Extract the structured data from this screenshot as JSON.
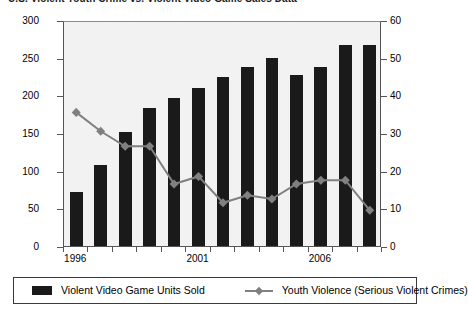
{
  "title": "U.S. Violent Youth Crime vs. Violent Video Game Sales Data",
  "legend": {
    "bars_label": "Violent Video Game Units Sold",
    "line_label": "Youth Violence (Serious Violent Crimes)",
    "bar_swatch_icon": "bar-swatch-icon",
    "line_swatch_icon": "line-marker-swatch-icon"
  },
  "colors": {
    "bar": "#1a1a1a",
    "line": "#808080",
    "plot_background": "#f2f2f2",
    "axis": "#555555",
    "text": "#000000"
  },
  "chart_data": {
    "type": "bar",
    "title": "U.S. Violent Youth Crime vs. Violent Video Game Sales Data",
    "xlabel": "",
    "ylabel": "",
    "grid": false,
    "legend_position": "bottom",
    "categories": [
      "1996",
      "1997",
      "1998",
      "1999",
      "2000",
      "2001",
      "2002",
      "2003",
      "2004",
      "2005",
      "2006",
      "2007",
      "2008"
    ],
    "x_tick_labels_shown": [
      "1996",
      "2001",
      "2006"
    ],
    "left_axis": {
      "name": "Violent Video Game Units Sold",
      "ylim": [
        0,
        300
      ],
      "ticks": [
        0,
        50,
        100,
        150,
        200,
        250,
        300
      ]
    },
    "right_axis": {
      "name": "Youth Violence (Serious Violent Crimes)",
      "ylim": [
        0,
        60
      ],
      "ticks": [
        0,
        10,
        20,
        30,
        40,
        50,
        60
      ]
    },
    "series": [
      {
        "name": "Violent Video Game Units Sold",
        "type": "bar",
        "axis": "left",
        "color": "#1a1a1a",
        "values": [
          72,
          107,
          152,
          183,
          197,
          210,
          224,
          238,
          249,
          227,
          238,
          267,
          267
        ]
      },
      {
        "name": "Youth Violence (Serious Violent Crimes)",
        "type": "line",
        "axis": "right",
        "color": "#808080",
        "marker": "diamond",
        "values": [
          36,
          31,
          27,
          27,
          17,
          19,
          12,
          14,
          13,
          17,
          18,
          18,
          10
        ]
      }
    ]
  }
}
